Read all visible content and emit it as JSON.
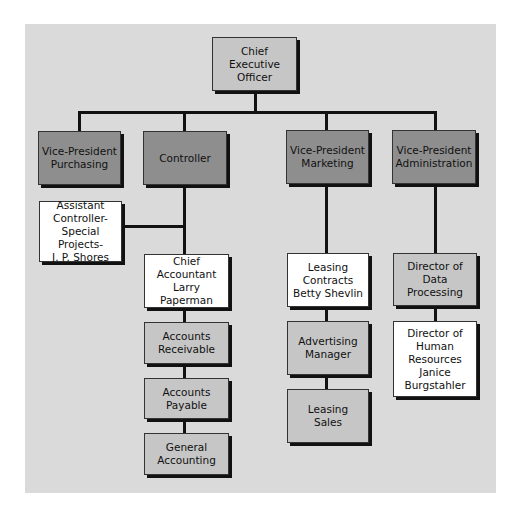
{
  "chart": {
    "ceo": "Chief Executive\nOfficer",
    "vp_purchasing": "Vice-President\nPurchasing",
    "controller": "Controller",
    "vp_marketing": "Vice-President\nMarketing",
    "vp_admin": "Vice-President\nAdministration",
    "assistant_controller": "Assistant\nController-\nSpecial Projects-\nJ. P. Shores",
    "chief_accountant": "Chief\nAccountant\nLarry Paperman",
    "accounts_receivable": "Accounts\nReceivable",
    "accounts_payable": "Accounts\nPayable",
    "general_accounting": "General\nAccounting",
    "leasing_contracts": "Leasing\nContracts\nBetty Shevlin",
    "advertising_manager": "Advertising\nManager",
    "leasing_sales": "Leasing\nSales",
    "director_data_processing": "Director of\nData\nProcessing",
    "director_hr": "Director of\nHuman\nResources\nJanice\nBurgstahler"
  },
  "colors": {
    "panel": "#dadada",
    "vp_box": "#8e8e8e",
    "unit_box": "#c6c6c6",
    "person_box": "#ffffff",
    "line": "#111111"
  }
}
